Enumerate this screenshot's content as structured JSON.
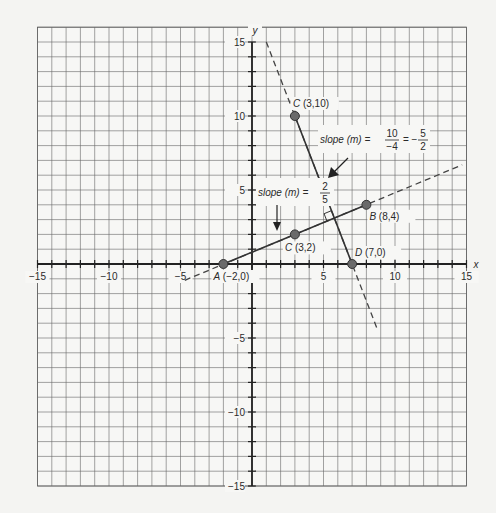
{
  "chart_data": {
    "type": "line",
    "title": "",
    "xlabel": "x",
    "ylabel": "y",
    "xlim": [
      -15,
      15
    ],
    "ylim": [
      -15,
      15
    ],
    "grid": true,
    "x_ticks": [
      -15,
      -10,
      -5,
      5,
      10,
      15
    ],
    "y_ticks": [
      -15,
      -10,
      -5,
      5,
      10,
      15
    ],
    "x_tick_labels": [
      "−15",
      "−10",
      "−5",
      "5",
      "10",
      "15"
    ],
    "y_tick_labels": [
      "−15",
      "−10",
      "−5",
      "5",
      "10",
      "15"
    ],
    "series": [
      {
        "name": "line AB",
        "slope": "2/5",
        "segment": [
          [
            -2,
            0
          ],
          [
            8,
            4
          ]
        ],
        "dashed_extension": [
          [
            -4.7,
            -1.1
          ],
          [
            14.7,
            6.7
          ]
        ]
      },
      {
        "name": "line CD",
        "slope": "-5/2",
        "segment": [
          [
            3,
            10
          ],
          [
            7,
            0
          ]
        ],
        "dashed_extension": [
          [
            1,
            15
          ],
          [
            8.8,
            -4.5
          ]
        ]
      }
    ],
    "points": [
      {
        "name": "A",
        "coord": "(−2,0)",
        "x": -2,
        "y": 0
      },
      {
        "name": "C",
        "coord": "(3,2)",
        "x": 3,
        "y": 2
      },
      {
        "name": "B",
        "coord": "(8,4)",
        "x": 8,
        "y": 4
      },
      {
        "name": "C",
        "coord": "(3,10)",
        "x": 3,
        "y": 10
      },
      {
        "name": "D",
        "coord": "(7,0)",
        "x": 7,
        "y": 0
      }
    ],
    "annotations": [
      {
        "text": "slope (m) = 2/5",
        "prefix": "slope (m) =",
        "num": "2",
        "den": "5"
      },
      {
        "text": "slope (m) = 10/−4 = −5/2",
        "prefix": "slope (m) =",
        "num1": "10",
        "den1": "−4",
        "eq": "= −",
        "num2": "5",
        "den2": "2"
      }
    ],
    "right_angle_marker": {
      "x": 5.76,
      "y": 3.1
    }
  }
}
